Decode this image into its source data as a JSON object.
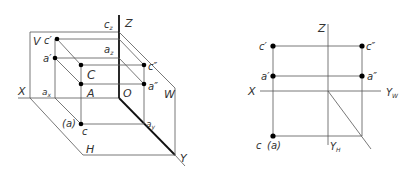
{
  "figure": {
    "left_view": {
      "title": "3D projection of points A and C onto V, H, W planes",
      "planes": [
        "V",
        "H",
        "W"
      ],
      "axes": [
        "X",
        "Y",
        "Z",
        "O"
      ],
      "labels": {
        "V": "V",
        "H": "H",
        "W": "W",
        "X": "X",
        "Y": "Y",
        "Z": "Z",
        "O": "O",
        "cz": "c",
        "cz_sub": "z",
        "az": "a",
        "az_sub": "z",
        "ax": "a",
        "ax_sub": "x",
        "ay": "a",
        "ay_sub": "y",
        "c_prime": "c′",
        "a_prime": "a′",
        "C": "C",
        "A": "A",
        "c_dprime": "c″",
        "a_dprime": "a″",
        "c_h": "c",
        "a_h": "(a)"
      }
    },
    "right_view": {
      "title": "Unfolded orthographic projection",
      "labels": {
        "Z": "Z",
        "X": "X",
        "YW": "Y",
        "YW_sub": "W",
        "YH": "Y",
        "YH_sub": "H",
        "c_prime": "c′",
        "a_prime": "a′",
        "c_dprime": "c″",
        "a_dprime": "a″",
        "c_h": "c",
        "a_h": "(a)"
      }
    },
    "colors": {
      "line": "#555555",
      "axis": "#111111",
      "point": "#000000",
      "text": "#333333"
    }
  }
}
